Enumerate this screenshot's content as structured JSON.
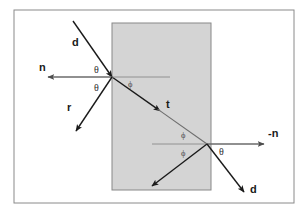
{
  "figure": {
    "frame": {
      "border_color": "#8a8a8a",
      "background_color": "#ffffff",
      "x": 14,
      "y": 10,
      "width": 280,
      "height": 193
    },
    "slab": {
      "name": "transparent-medium-slab",
      "fill_color": "#d4d4d4",
      "border_color": "#888888",
      "x": 112,
      "y": 23,
      "width": 99,
      "height": 167
    },
    "colors": {
      "ray_black": "#1a1a1a",
      "ray_gray": "#6e6e6e",
      "normal_gray": "#6b6b6b",
      "label_text": "#1a1a1a"
    },
    "points": {
      "entry": {
        "x": 112,
        "y": 77,
        "label": "entry-point"
      },
      "exit": {
        "x": 207,
        "y": 144,
        "label": "exit-point"
      }
    },
    "rays": [
      {
        "name": "incident-ray",
        "label": "d",
        "label_x": 72,
        "label_y": 46,
        "x1": 73,
        "y1": 21,
        "x2": 112,
        "y2": 77,
        "color": "#1a1a1a",
        "arrow": "end"
      },
      {
        "name": "incident-normal",
        "label": "n",
        "label_x": 39,
        "label_y": 71,
        "x1": 112,
        "y1": 77,
        "x2": 48,
        "y2": 77,
        "color": "#6b6b6b",
        "arrow": "end"
      },
      {
        "name": "reflected-ray",
        "label": "r",
        "label_x": 67,
        "label_y": 111,
        "x1": 112,
        "y1": 77,
        "x2": 76,
        "y2": 131,
        "color": "#1a1a1a",
        "arrow": "end"
      },
      {
        "name": "transmitted-ray",
        "label": "t",
        "label_x": 166,
        "label_y": 108,
        "x1": 112,
        "y1": 77,
        "x2": 207,
        "y2": 144,
        "color": "#6e6e6e",
        "arrow": "mid"
      },
      {
        "name": "entry-internal-normal",
        "label": "",
        "label_x": 0,
        "label_y": 0,
        "x1": 112,
        "y1": 77,
        "x2": 170,
        "y2": 77,
        "color": "#8a8a8a",
        "arrow": "none"
      },
      {
        "name": "exit-internal-normal",
        "label": "",
        "label_x": 0,
        "label_y": 0,
        "x1": 207,
        "y1": 144,
        "x2": 152,
        "y2": 144,
        "color": "#8a8a8a",
        "arrow": "none"
      },
      {
        "name": "exit-normal",
        "label": "-n",
        "label_x": 268,
        "label_y": 137,
        "x1": 207,
        "y1": 144,
        "x2": 264,
        "y2": 144,
        "color": "#6b6b6b",
        "arrow": "end"
      },
      {
        "name": "internally-reflected-ray",
        "label": "",
        "label_x": 0,
        "label_y": 0,
        "x1": 207,
        "y1": 144,
        "x2": 152,
        "y2": 186,
        "color": "#1a1a1a",
        "arrow": "end"
      },
      {
        "name": "exit-ray",
        "label": "d",
        "label_x": 250,
        "label_y": 193,
        "x1": 207,
        "y1": 144,
        "x2": 244,
        "y2": 192,
        "color": "#1a1a1a",
        "arrow": "end"
      }
    ],
    "angle_labels": [
      {
        "name": "theta-incident",
        "text": "θ",
        "x": 94,
        "y": 73,
        "size": "normal"
      },
      {
        "name": "theta-reflected",
        "text": "θ",
        "x": 94,
        "y": 91,
        "size": "normal"
      },
      {
        "name": "phi-entry",
        "text": "ϕ",
        "x": 128,
        "y": 87,
        "size": "small"
      },
      {
        "name": "phi-exit-upper",
        "text": "ϕ",
        "x": 181,
        "y": 138,
        "size": "small"
      },
      {
        "name": "phi-exit-lower",
        "text": "ϕ",
        "x": 181,
        "y": 156,
        "size": "small"
      },
      {
        "name": "theta-exit",
        "text": "θ",
        "x": 219,
        "y": 155,
        "size": "normal"
      }
    ]
  }
}
